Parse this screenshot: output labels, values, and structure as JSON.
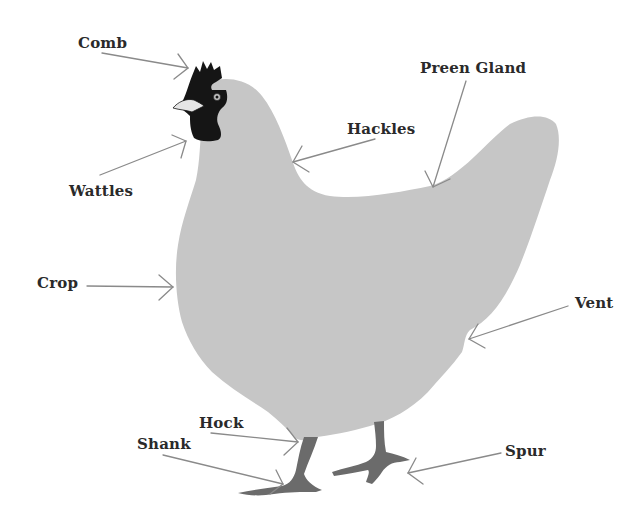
{
  "diagram": {
    "colors": {
      "body": "#c6c6c6",
      "head": "#151515",
      "legs": "#6b6b6b",
      "beak": "#e6e6e6",
      "arrow": "#8a8a8a",
      "text": "#2a2a2a",
      "background": "#ffffff"
    },
    "labels": [
      {
        "id": "comb",
        "text": "Comb"
      },
      {
        "id": "wattles",
        "text": "Wattles"
      },
      {
        "id": "hackles",
        "text": "Hackles"
      },
      {
        "id": "preen_gland",
        "text": "Preen Gland"
      },
      {
        "id": "crop",
        "text": "Crop"
      },
      {
        "id": "vent",
        "text": "Vent"
      },
      {
        "id": "hock",
        "text": "Hock"
      },
      {
        "id": "shank",
        "text": "Shank"
      },
      {
        "id": "spur",
        "text": "Spur"
      }
    ]
  }
}
